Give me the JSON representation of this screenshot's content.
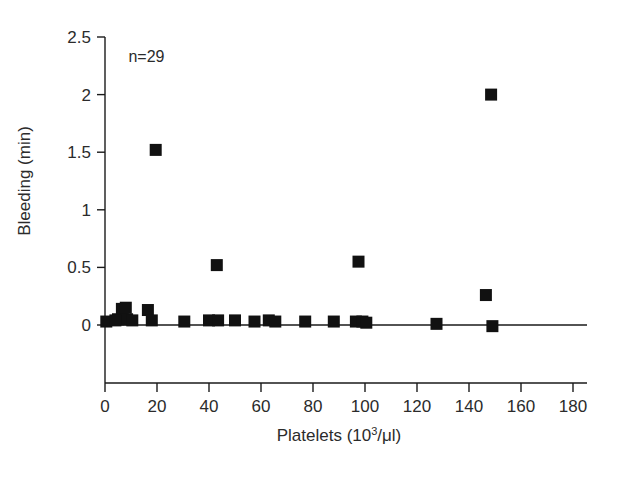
{
  "chart_data": {
    "type": "scatter",
    "title": "",
    "xlabel": "Platelets (10³/μl)",
    "xlabel_parts": {
      "base": "Platelets (10",
      "sup": "3",
      "tail": "/μl)"
    },
    "ylabel": "Bleeding (min)",
    "xlim": [
      0,
      180
    ],
    "ylim": [
      0,
      2.5
    ],
    "xticks": [
      0,
      20,
      40,
      60,
      80,
      100,
      120,
      140,
      160,
      180
    ],
    "xticklabels": [
      "0",
      "20",
      "40",
      "60",
      "80",
      "100",
      "120",
      "140",
      "160",
      "180"
    ],
    "yticks": [
      0,
      0.5,
      1,
      1.5,
      2,
      2.5
    ],
    "yticklabels": [
      "0",
      "0.5",
      "1",
      "1.5",
      "2",
      "2.5"
    ],
    "grid": false,
    "legend": null,
    "marker_shape": "square",
    "marker_color": "#111111",
    "annotations": [
      {
        "text": "n=29",
        "x": 9,
        "y": 2.28
      }
    ],
    "n_points": 29,
    "points": [
      {
        "x": 0.5,
        "y": 0.03
      },
      {
        "x": 5.0,
        "y": 0.05
      },
      {
        "x": 6.5,
        "y": 0.14
      },
      {
        "x": 7.0,
        "y": 0.05
      },
      {
        "x": 8.5,
        "y": 0.05
      },
      {
        "x": 10.5,
        "y": 0.04
      },
      {
        "x": 16.5,
        "y": 0.13
      },
      {
        "x": 18.0,
        "y": 0.04
      },
      {
        "x": 19.5,
        "y": 1.52
      },
      {
        "x": 30.5,
        "y": 0.03
      },
      {
        "x": 40.0,
        "y": 0.04
      },
      {
        "x": 43.0,
        "y": 0.52
      },
      {
        "x": 43.5,
        "y": 0.04
      },
      {
        "x": 50.0,
        "y": 0.04
      },
      {
        "x": 57.5,
        "y": 0.03
      },
      {
        "x": 63.0,
        "y": 0.04
      },
      {
        "x": 65.5,
        "y": 0.03
      },
      {
        "x": 77.0,
        "y": 0.03
      },
      {
        "x": 88.0,
        "y": 0.03
      },
      {
        "x": 96.5,
        "y": 0.03
      },
      {
        "x": 97.5,
        "y": 0.55
      },
      {
        "x": 99.0,
        "y": 0.03
      },
      {
        "x": 100.5,
        "y": 0.02
      },
      {
        "x": 127.5,
        "y": 0.01
      },
      {
        "x": 146.5,
        "y": 0.26
      },
      {
        "x": 148.5,
        "y": 2.0
      },
      {
        "x": 149.0,
        "y": -0.01
      },
      {
        "x": 8.0,
        "y": 0.15
      },
      {
        "x": 4.0,
        "y": 0.04
      }
    ]
  }
}
